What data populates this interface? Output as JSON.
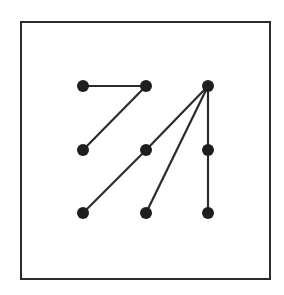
{
  "diagram": {
    "type": "graph",
    "frame": {
      "x": 21,
      "y": 22,
      "width": 249,
      "height": 257,
      "stroke": "#2b2b2b",
      "stroke_width": 2
    },
    "style": {
      "node_color": "#1e1e1e",
      "edge_color": "#2b2b2b",
      "node_radius": 6,
      "edge_width": 2.2
    },
    "columns_x": [
      83,
      146,
      208
    ],
    "rows_y": [
      86,
      150,
      213
    ],
    "nodes": [
      {
        "id": "n00",
        "col": 0,
        "row": 0
      },
      {
        "id": "n10",
        "col": 1,
        "row": 0
      },
      {
        "id": "n20",
        "col": 2,
        "row": 0
      },
      {
        "id": "n01",
        "col": 0,
        "row": 1
      },
      {
        "id": "n11",
        "col": 1,
        "row": 1
      },
      {
        "id": "n21",
        "col": 2,
        "row": 1
      },
      {
        "id": "n02",
        "col": 0,
        "row": 2
      },
      {
        "id": "n12",
        "col": 1,
        "row": 2
      },
      {
        "id": "n22",
        "col": 2,
        "row": 2
      }
    ],
    "edges": [
      [
        "n00",
        "n10"
      ],
      [
        "n10",
        "n01"
      ],
      [
        "n20",
        "n11"
      ],
      [
        "n11",
        "n02"
      ],
      [
        "n20",
        "n12"
      ],
      [
        "n20",
        "n21"
      ],
      [
        "n21",
        "n22"
      ]
    ]
  }
}
